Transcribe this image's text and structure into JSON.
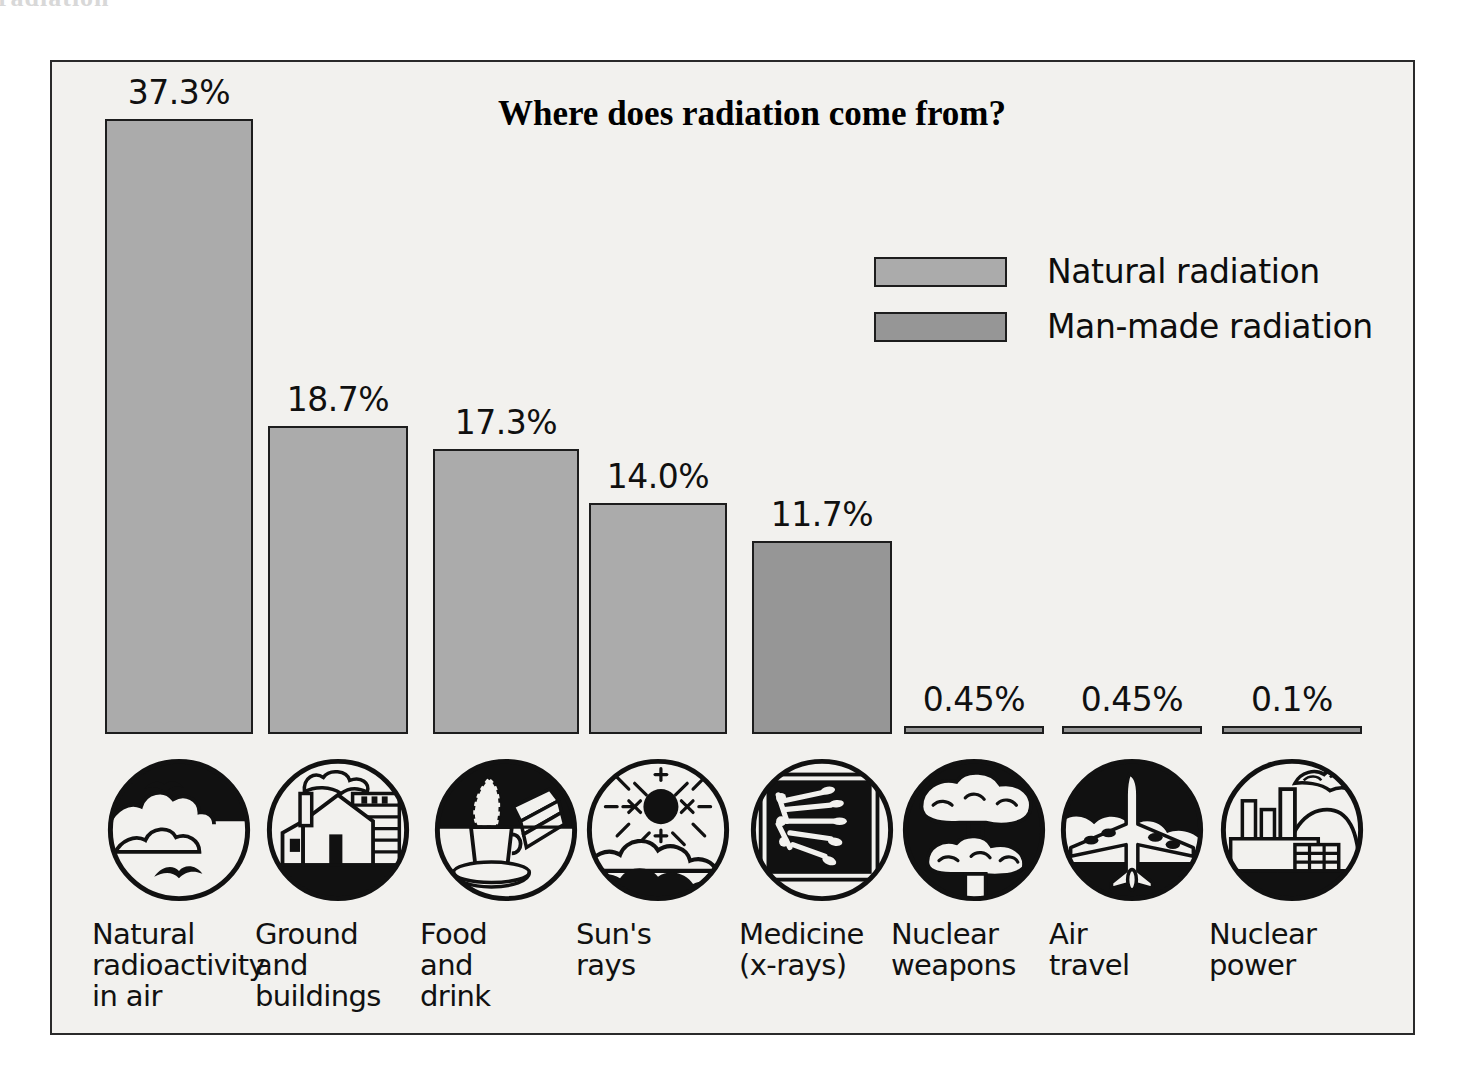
{
  "scan_artifact_text": "radiation",
  "chart": {
    "title": "Where does radiation come from?",
    "legend": [
      {
        "label": "Natural radiation",
        "color": "#ababab",
        "key": "natural"
      },
      {
        "label": "Man-made radiation",
        "color": "#969696",
        "key": "manmade"
      }
    ]
  },
  "chart_data": {
    "type": "bar",
    "title": "Where does radiation come from?",
    "xlabel": "",
    "ylabel": "",
    "ylim": [
      0,
      37.3
    ],
    "grid": false,
    "legend_position": "top-right",
    "categories": [
      "Natural radioactivity in air",
      "Ground and buildings",
      "Food and drink",
      "Sun's rays",
      "Medicine (x-rays)",
      "Nuclear weapons",
      "Air travel",
      "Nuclear power"
    ],
    "values": [
      37.3,
      18.7,
      17.3,
      14.0,
      11.7,
      0.45,
      0.45,
      0.1
    ],
    "value_labels": [
      "37.3%",
      "18.7%",
      "17.3%",
      "14.0%",
      "11.7%",
      "0.45%",
      "0.45%",
      "0.1%"
    ],
    "groups": [
      "natural",
      "natural",
      "natural",
      "natural",
      "manmade",
      "manmade",
      "manmade",
      "manmade"
    ],
    "series": [
      {
        "name": "Natural radiation",
        "values": [
          37.3,
          18.7,
          17.3,
          14.0,
          null,
          null,
          null,
          null
        ]
      },
      {
        "name": "Man-made radiation",
        "values": [
          null,
          null,
          null,
          null,
          11.7,
          0.45,
          0.45,
          0.1
        ]
      }
    ]
  },
  "bars": [
    {
      "label_lines": [
        "Natural",
        "radioactivity",
        "in air"
      ],
      "value_label": "37.3%",
      "value": 37.3,
      "group": "natural",
      "icon": "clouds-birds-sky-icon"
    },
    {
      "label_lines": [
        "Ground",
        "and",
        "buildings"
      ],
      "value_label": "18.7%",
      "value": 18.7,
      "group": "natural",
      "icon": "house-buildings-icon"
    },
    {
      "label_lines": [
        "Food",
        "and",
        "drink"
      ],
      "value_label": "17.3%",
      "value": 17.3,
      "group": "natural",
      "icon": "coffee-sandwich-icon"
    },
    {
      "label_lines": [
        "Sun's",
        "rays"
      ],
      "value_label": "14.0%",
      "value": 14.0,
      "group": "natural",
      "icon": "sun-rays-clouds-icon"
    },
    {
      "label_lines": [
        "Medicine",
        "(x-rays)"
      ],
      "value_label": "11.7%",
      "value": 11.7,
      "group": "manmade",
      "icon": "xray-hand-icon"
    },
    {
      "label_lines": [
        "Nuclear",
        "weapons"
      ],
      "value_label": "0.45%",
      "value": 0.45,
      "group": "manmade",
      "icon": "mushroom-cloud-icon"
    },
    {
      "label_lines": [
        "Air",
        "travel"
      ],
      "value_label": "0.45%",
      "value": 0.45,
      "group": "manmade",
      "icon": "airplane-icon"
    },
    {
      "label_lines": [
        "Nuclear",
        "power"
      ],
      "value_label": "0.1%",
      "value": 0.1,
      "group": "manmade",
      "icon": "power-plant-icon"
    }
  ],
  "colors": {
    "natural": "#ababab",
    "manmade": "#969696",
    "outline": "#1d1d1d",
    "background": "#f2f1ee",
    "text": "#101010"
  }
}
